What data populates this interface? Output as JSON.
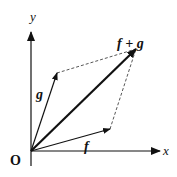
{
  "diagram": {
    "type": "vector-addition-parallelogram",
    "origin_label": "O",
    "axes": {
      "x_label": "x",
      "y_label": "y"
    },
    "vectors": [
      {
        "id": "f",
        "label": "f",
        "from": [
          31,
          151
        ],
        "to": [
          110,
          129
        ],
        "style": "thin"
      },
      {
        "id": "g",
        "label": "g",
        "from": [
          31,
          151
        ],
        "to": [
          57,
          73
        ],
        "style": "thin"
      },
      {
        "id": "f_plus_g",
        "label": "f + g",
        "from": [
          31,
          151
        ],
        "to": [
          136,
          49
        ],
        "style": "bold"
      }
    ],
    "dashed_edges": [
      {
        "from": [
          57,
          73
        ],
        "to": [
          136,
          49
        ]
      },
      {
        "from": [
          110,
          129
        ],
        "to": [
          136,
          49
        ]
      }
    ],
    "colors": {
      "stroke": "#111111",
      "dashed": "#444444",
      "background": "#ffffff"
    }
  }
}
